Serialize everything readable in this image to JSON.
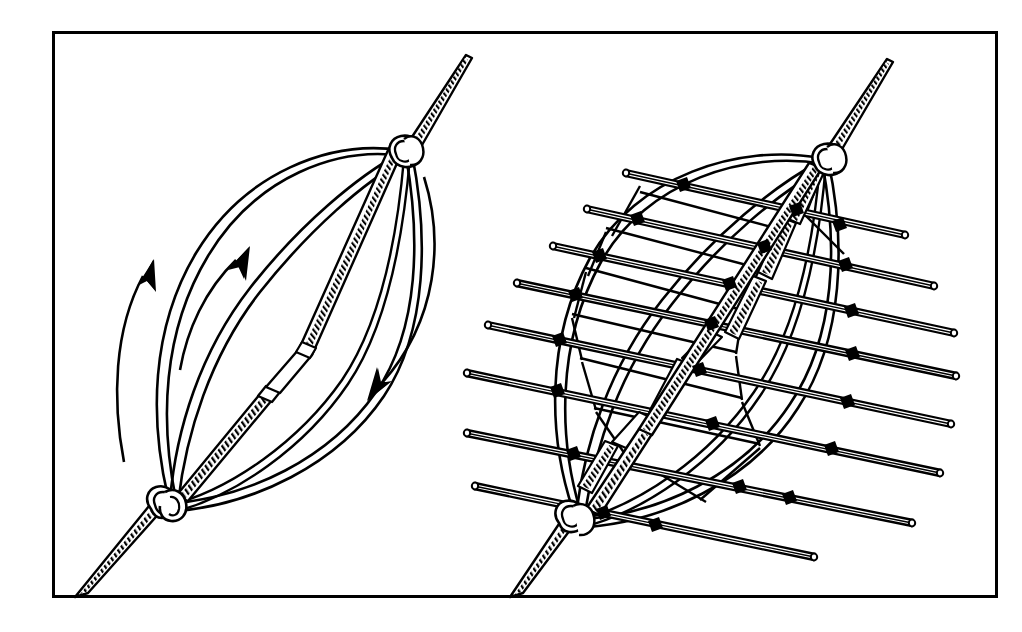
{
  "figure": {
    "title": "Basketry frame construction: lashing ribs to a stake and weaving cross rods",
    "medium": "black and white line drawing",
    "background_color": "#ffffff",
    "ink_color": "#000000",
    "border": {
      "x": 52,
      "y": 31,
      "width": 945,
      "height": 566,
      "stroke_width": 3,
      "color": "#000000"
    },
    "panel_count": 2
  },
  "panels": [
    {
      "id": "left-panel",
      "name": "step-one-ribs-lashed",
      "caption_text": "",
      "description": "A tapered hatched stake runs from lower-left to upper-right. Four slender curved ribs are lashed to the stake at two wrapped knots, bowing out into a pointed oval (lens) shape. Curved motion arrows show the ribs being spread apart.",
      "stake": {
        "name": "center-stake",
        "shading": "hatched",
        "from": [
          80,
          600
        ],
        "to": [
          478,
          55
        ],
        "segments": 3,
        "knots": [
          "bottom-lashing-knot",
          "top-lashing-knot"
        ]
      },
      "ribs_count": 4,
      "knots": [
        {
          "name": "bottom-lashing-knot",
          "x": 160,
          "y": 505
        },
        {
          "name": "top-lashing-knot",
          "x": 405,
          "y": 150
        }
      ],
      "arrows": [
        {
          "name": "motion-arrow-outer-left",
          "direction": "up",
          "tip": [
            146,
            266
          ]
        },
        {
          "name": "motion-arrow-inner-left",
          "direction": "up",
          "tip": [
            240,
            250
          ]
        },
        {
          "name": "motion-arrow-right",
          "direction": "down",
          "tip": [
            374,
            397
          ]
        }
      ]
    },
    {
      "id": "right-panel",
      "name": "step-two-rods-woven",
      "caption_text": "",
      "description": "The same lashed rib frame, now with eight straight cylindrical rods laid horizontally across it. Each rod crosses the ribs and is tied with a solid black lashing knot at every intersection. Short hatched cross-pieces run down the middle of the frame.",
      "stake": {
        "name": "center-stake",
        "shading": "hatched",
        "from": [
          515,
          600
        ],
        "to": [
          898,
          60
        ],
        "segments": 3,
        "knots": [
          "bottom-lashing-knot",
          "top-lashing-knot"
        ]
      },
      "ribs_count": 4,
      "rods_count": 8,
      "knots": [
        {
          "name": "bottom-lashing-knot",
          "x": 570,
          "y": 520
        },
        {
          "name": "top-lashing-knot",
          "x": 829,
          "y": 157
        }
      ],
      "rods": [
        {
          "name": "cross-rod-1",
          "left": [
            625,
            170
          ],
          "right": [
            905,
            232
          ]
        },
        {
          "name": "cross-rod-2",
          "left": [
            586,
            207
          ],
          "right": [
            934,
            283
          ]
        },
        {
          "name": "cross-rod-3",
          "left": [
            552,
            243
          ],
          "right": [
            954,
            330
          ]
        },
        {
          "name": "cross-rod-4",
          "left": [
            516,
            280
          ],
          "right": [
            956,
            373
          ]
        },
        {
          "name": "cross-rod-5",
          "left": [
            487,
            322
          ],
          "right": [
            951,
            421
          ]
        },
        {
          "name": "cross-rod-6",
          "left": [
            466,
            370
          ],
          "right": [
            940,
            470
          ]
        },
        {
          "name": "cross-rod-7",
          "left": [
            466,
            430
          ],
          "right": [
            912,
            520
          ]
        },
        {
          "name": "cross-rod-8",
          "left": [
            474,
            483
          ],
          "right": [
            814,
            554
          ]
        }
      ]
    }
  ],
  "labels": {
    "has_text_labels": false,
    "text_items": []
  }
}
